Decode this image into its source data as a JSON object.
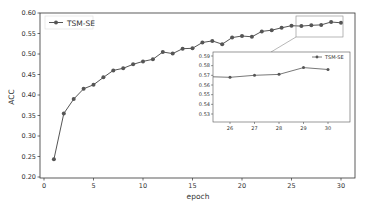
{
  "chart_data": {
    "type": "line",
    "title": "",
    "xlabel": "epoch",
    "ylabel": "ACC",
    "xlim": [
      0,
      30
    ],
    "ylim": [
      0.2,
      0.6
    ],
    "xticks": [
      0,
      5,
      10,
      15,
      20,
      25,
      30
    ],
    "yticks": [
      "0.20",
      "0.25",
      "0.30",
      "0.35",
      "0.40",
      "0.45",
      "0.50",
      "0.55",
      "0.60"
    ],
    "grid": false,
    "legend_position": "upper left",
    "series": [
      {
        "name": "TSM-SE",
        "color": "#555555",
        "marker": "circle",
        "x": [
          1,
          2,
          3,
          4,
          5,
          6,
          7,
          8,
          9,
          10,
          11,
          12,
          13,
          14,
          15,
          16,
          17,
          18,
          19,
          20,
          21,
          22,
          23,
          24,
          25,
          26,
          27,
          28,
          29,
          30
        ],
        "values": [
          0.243,
          0.355,
          0.39,
          0.415,
          0.425,
          0.443,
          0.46,
          0.465,
          0.475,
          0.482,
          0.487,
          0.505,
          0.501,
          0.513,
          0.514,
          0.528,
          0.532,
          0.524,
          0.54,
          0.544,
          0.542,
          0.555,
          0.558,
          0.564,
          0.569,
          0.568,
          0.57,
          0.571,
          0.578,
          0.576
        ]
      }
    ],
    "inset": {
      "xlim": [
        25.3,
        30.9
      ],
      "ylim": [
        0.523,
        0.593
      ],
      "xticks": [
        26,
        27,
        28,
        29,
        30
      ],
      "yticks": [
        "0.53",
        "0.54",
        "0.55",
        "0.56",
        "0.57",
        "0.58",
        "0.59"
      ],
      "legend": "TSM-SE",
      "legend_position": "upper right",
      "zoom_region": {
        "x": [
          25.3,
          30.9
        ],
        "y": [
          0.563,
          0.593
        ]
      }
    }
  },
  "labels": {
    "xlabel": "epoch",
    "ylabel": "ACC",
    "legend": "TSM-SE",
    "inset_legend": "TSM-SE"
  }
}
